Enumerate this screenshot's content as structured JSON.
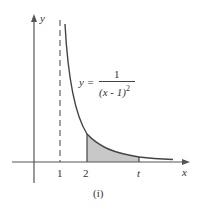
{
  "figure": {
    "caption": "(i)",
    "function_label": {
      "lhs": "y =",
      "numerator": "1",
      "denominator": "(x - 1)",
      "exponent": "2"
    },
    "axes": {
      "x_label": "x",
      "y_label": "y"
    },
    "ticks": {
      "x": [
        "1",
        "2",
        "t"
      ]
    },
    "asymptote": {
      "x": 1,
      "style": "dashed"
    },
    "shaded_region": {
      "from": "2",
      "to": "t",
      "color": "#c8c8c8"
    },
    "colors": {
      "curve": "#444444",
      "axis": "#555555",
      "shade": "#c8c8c8"
    }
  }
}
